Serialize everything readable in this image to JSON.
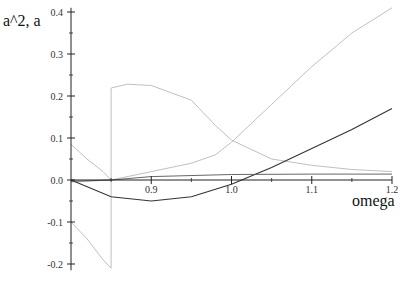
{
  "chart_data": {
    "type": "line",
    "title": "",
    "xlabel": "omega",
    "ylabel": "a^2, a",
    "xlim": [
      0.8,
      1.2
    ],
    "ylim": [
      -0.21,
      0.41
    ],
    "x_ticks": [
      "0.9",
      "1.0",
      "1.1",
      "1.2"
    ],
    "y_ticks": [
      "0.4",
      "0.3",
      "0.2",
      "0.1",
      "0.0",
      "-0.1",
      "-0.2"
    ],
    "grid": false,
    "legend": null,
    "series": [
      {
        "name": "a^2 (rising, light)",
        "color": "#b8b8b8",
        "points": [
          [
            0.8,
            -0.005
          ],
          [
            0.85,
            0.0
          ],
          [
            0.9,
            0.02
          ],
          [
            0.95,
            0.04
          ],
          [
            0.98,
            0.06
          ],
          [
            1.0,
            0.09
          ],
          [
            1.05,
            0.18
          ],
          [
            1.1,
            0.27
          ],
          [
            1.15,
            0.35
          ],
          [
            1.2,
            0.41
          ]
        ]
      },
      {
        "name": "a^2 (decaying with jump, light)",
        "color": "#b8b8b8",
        "points": [
          [
            0.8,
            0.085
          ],
          [
            0.82,
            0.05
          ],
          [
            0.84,
            0.02
          ],
          [
            0.85,
            0.0
          ],
          [
            0.85,
            0.219
          ],
          [
            0.87,
            0.228
          ],
          [
            0.9,
            0.225
          ],
          [
            0.95,
            0.19
          ],
          [
            0.98,
            0.13
          ],
          [
            1.0,
            0.095
          ],
          [
            1.05,
            0.05
          ],
          [
            1.1,
            0.035
          ],
          [
            1.15,
            0.025
          ],
          [
            1.2,
            0.02
          ]
        ]
      },
      {
        "name": "a (branch, light negative)",
        "color": "#b8b8b8",
        "points": [
          [
            0.8,
            -0.1
          ],
          [
            0.82,
            -0.14
          ],
          [
            0.84,
            -0.19
          ],
          [
            0.85,
            -0.21
          ],
          [
            0.85,
            0.0
          ]
        ]
      },
      {
        "name": "a (dark, dips then rises)",
        "color": "#333333",
        "points": [
          [
            0.8,
            0.0
          ],
          [
            0.85,
            -0.04
          ],
          [
            0.9,
            -0.05
          ],
          [
            0.95,
            -0.04
          ],
          [
            1.0,
            -0.01
          ],
          [
            1.05,
            0.03
          ],
          [
            1.1,
            0.075
          ],
          [
            1.15,
            0.12
          ],
          [
            1.2,
            0.17
          ]
        ]
      },
      {
        "name": "a (dark, flat small)",
        "color": "#555555",
        "points": [
          [
            0.8,
            -0.003
          ],
          [
            0.85,
            0.0
          ],
          [
            0.9,
            0.008
          ],
          [
            1.0,
            0.013
          ],
          [
            1.1,
            0.014
          ],
          [
            1.2,
            0.014
          ]
        ]
      }
    ]
  }
}
